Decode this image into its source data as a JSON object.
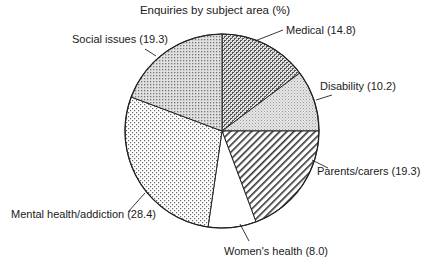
{
  "chart_data": {
    "type": "pie",
    "title": "Enquiries by subject area (%)",
    "start_angle": "12 o'clock",
    "direction": "clockwise",
    "slices": [
      {
        "label": "Medical",
        "value": 14.8,
        "display": "Medical (14.8)",
        "fill": "crosshatch-dark"
      },
      {
        "label": "Disability",
        "value": 10.2,
        "display": "Disability (10.2)",
        "fill": "fine-grey-dots"
      },
      {
        "label": "Parents/carers",
        "value": 19.3,
        "display": "Parents/carers (19.3)",
        "fill": "diagonal-lines"
      },
      {
        "label": "Women's health",
        "value": 8.0,
        "display": "Women's health (8.0)",
        "fill": "white"
      },
      {
        "label": "Mental health/addiction",
        "value": 28.4,
        "display": "Mental health/addiction (28.4)",
        "fill": "sparse-dots"
      },
      {
        "label": "Social issues",
        "value": 19.3,
        "display": "Social issues (19.3)",
        "fill": "grid-dots"
      }
    ],
    "legend": "none (direct labels with leader lines)"
  },
  "labels": {
    "title": "Enquiries by subject area (%)",
    "medical": "Medical (14.8)",
    "disability": "Disability (10.2)",
    "parents": "Parents/carers (19.3)",
    "womens": "Women's health (8.0)",
    "mental": "Mental health/addiction (28.4)",
    "social": "Social issues (19.3)"
  }
}
